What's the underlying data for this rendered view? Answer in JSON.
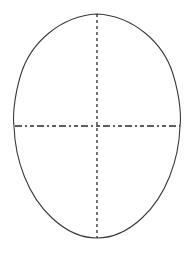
{
  "figure": {
    "background_color": "#ffffff",
    "stroke_color": "#3a3a3a",
    "axis_color": "#2b2b2b",
    "canvas": {
      "width": 194,
      "height": 258
    },
    "outline": {
      "name": "egg-shaped oval",
      "description": "Closed curve, slightly pointed apex at top, broadly rounded at bottom",
      "stroke_width": 1.1,
      "fill": "none",
      "top_point": {
        "x": 97,
        "y": 14
      },
      "bottom_point": {
        "x": 97,
        "y": 238
      },
      "left_point": {
        "x": 15,
        "y": 126
      },
      "right_point": {
        "x": 180,
        "y": 126
      },
      "width": 165,
      "height": 224,
      "path": "M 97 14 C 133 16 163 42 173 74 C 181 100 181 120 180 126 C 179 160 166 196 142 218 C 126 233 111 238 97 238 C 83 238 68 233 52 218 C 28 196 15 160 14 126 C 13 120 13 100 21 74 C 31 42 61 16 97 14 Z"
    },
    "axes": [
      {
        "name": "vertical-axis",
        "orientation": "vertical",
        "style": "dashed",
        "dash_pattern": "3 3",
        "stroke_width": 1.3,
        "from": {
          "x": 97,
          "y": 14
        },
        "to": {
          "x": 97,
          "y": 238
        },
        "length": 224
      },
      {
        "name": "horizontal-axis",
        "orientation": "horizontal",
        "style": "dash-dot",
        "dash_pattern": "7 3 2 3 4 3",
        "stroke_width": 1.3,
        "from": {
          "x": 15,
          "y": 126
        },
        "to": {
          "x": 180,
          "y": 126
        },
        "length": 165
      }
    ],
    "center_point": {
      "x": 97,
      "y": 126
    }
  }
}
